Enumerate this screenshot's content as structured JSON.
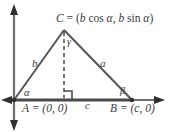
{
  "figure": {
    "background_color": "#ffffff",
    "stroke_color": "#555555",
    "text_color": "#3b3b3b"
  },
  "axes": {
    "origin_label": "A = (0, 0)",
    "x_axis_name": "horizontal-axis",
    "y_axis_name": "vertical-axis"
  },
  "labels": {
    "vertex_c": "C = (b cos α, b sin α)",
    "vertex_c_parts": {
      "name": "C",
      "equals": "=",
      "open": "(",
      "b1": "b",
      "cos": "cos",
      "alpha1": "α",
      "comma": ",",
      "b2": "b",
      "sin": "sin",
      "alpha2": "α",
      "close": ")"
    },
    "point_a": "A = (0, 0)",
    "point_b": "B = (c, 0)",
    "side_a": "a",
    "side_b": "b",
    "side_c": "c",
    "angle_alpha": "α",
    "angle_beta": "β",
    "angle_gamma": "γ"
  },
  "geometry": {
    "vertex_a": [
      14,
      100
    ],
    "vertex_b": [
      132,
      100
    ],
    "vertex_c": [
      64,
      30
    ],
    "altitude_foot": [
      64,
      100
    ],
    "right_angle_marker": true,
    "altitude_style": "dashed"
  }
}
